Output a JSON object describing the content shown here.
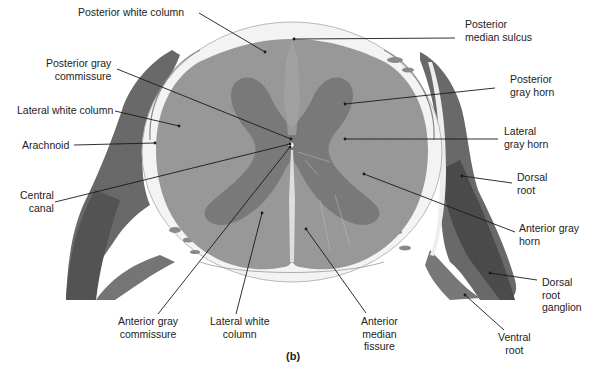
{
  "figure": {
    "panel_label": "(b)",
    "colors": {
      "background": "#ffffff",
      "white_matter": "#9a9a9a",
      "gray_matter": "#7e7e7e",
      "meninges": "#e8e8e8",
      "root_tissue": "#6a6a6a",
      "ganglion_dark": "#4a4a4a",
      "leader_line": "#1a1a1a",
      "text": "#222222"
    }
  },
  "labels": [
    {
      "id": "posterior-white-column",
      "text": "Posterior white column",
      "x": 78,
      "y": 6,
      "align": "left",
      "line": [
        [
          199,
          13
        ],
        [
          265,
          52
        ]
      ]
    },
    {
      "id": "posterior-median-sulcus",
      "text": "Posterior\nmedian sulcus",
      "x": 465,
      "y": 18,
      "align": "left",
      "line": [
        [
          455,
          38
        ],
        [
          294,
          39
        ]
      ]
    },
    {
      "id": "posterior-gray-commissure",
      "text": "Posterior gray\ncommissure",
      "x": 46,
      "y": 57,
      "align": "endalign",
      "line": [
        [
          117,
          69
        ],
        [
          291,
          139
        ]
      ]
    },
    {
      "id": "posterior-gray-horn",
      "text": "Posterior\ngray horn",
      "x": 510,
      "y": 73,
      "align": "left",
      "line": [
        [
          495,
          88
        ],
        [
          345,
          104
        ]
      ]
    },
    {
      "id": "lateral-white-column-left",
      "text": "Lateral white column",
      "x": 17,
      "y": 104,
      "align": "left",
      "line": [
        [
          115,
          111
        ],
        [
          179,
          126
        ]
      ]
    },
    {
      "id": "lateral-gray-horn",
      "text": "Lateral\ngray horn",
      "x": 504,
      "y": 125,
      "align": "left",
      "line": [
        [
          498,
          139
        ],
        [
          345,
          139
        ]
      ]
    },
    {
      "id": "arachnoid",
      "text": "Arachnoid",
      "x": 22,
      "y": 139,
      "align": "left",
      "line": [
        [
          74,
          145
        ],
        [
          155,
          143
        ]
      ]
    },
    {
      "id": "central-canal",
      "text": "Central\ncanal",
      "x": 20,
      "y": 189,
      "align": "endalign",
      "line": [
        [
          55,
          202
        ],
        [
          290,
          144
        ]
      ]
    },
    {
      "id": "dorsal-root",
      "text": "Dorsal\nroot",
      "x": 517,
      "y": 171,
      "align": "left",
      "line": [
        [
          512,
          183
        ],
        [
          462,
          176
        ]
      ]
    },
    {
      "id": "anterior-gray-horn",
      "text": "Anterior gray\nhorn",
      "x": 519,
      "y": 222,
      "align": "left",
      "line": [
        [
          515,
          232
        ],
        [
          364,
          174
        ]
      ]
    },
    {
      "id": "dorsal-root-ganglion",
      "text": "Dorsal\nroot\nganglion",
      "x": 542,
      "y": 276,
      "align": "left",
      "line": [
        [
          537,
          280
        ],
        [
          490,
          273
        ]
      ]
    },
    {
      "id": "anterior-gray-commissure",
      "text": "Anterior gray\ncommissure",
      "x": 118,
      "y": 315,
      "align": "center",
      "line": [
        [
          158,
          314
        ],
        [
          290,
          147
        ]
      ]
    },
    {
      "id": "lateral-white-column-bottom",
      "text": "Lateral white\ncolumn",
      "x": 210,
      "y": 315,
      "align": "center",
      "line": [
        [
          236,
          314
        ],
        [
          262,
          213
        ]
      ]
    },
    {
      "id": "anterior-median-fissure",
      "text": "Anterior\nmedian\nfissure",
      "x": 361,
      "y": 315,
      "align": "center",
      "line": [
        [
          366,
          313
        ],
        [
          306,
          229
        ]
      ]
    },
    {
      "id": "ventral-root",
      "text": "Ventral\nroot",
      "x": 498,
      "y": 331,
      "align": "center",
      "line": [
        [
          504,
          330
        ],
        [
          465,
          295
        ]
      ]
    }
  ]
}
